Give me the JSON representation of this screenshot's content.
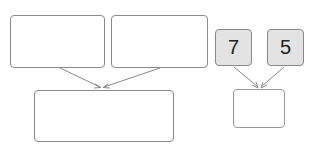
{
  "diagram": {
    "top_left_group": {
      "fruit": "apple",
      "count": 7
    },
    "top_right_group": {
      "fruit": "pear",
      "count": 5
    },
    "combined_group": {
      "apples": 7,
      "pears": 5
    },
    "number_left": "7",
    "number_right": "5",
    "answer_box": ""
  },
  "colors": {
    "border": "#8a8a8a",
    "number_box_fill": "#e3e3e3",
    "fruit_shade": "#8c8c8c"
  }
}
